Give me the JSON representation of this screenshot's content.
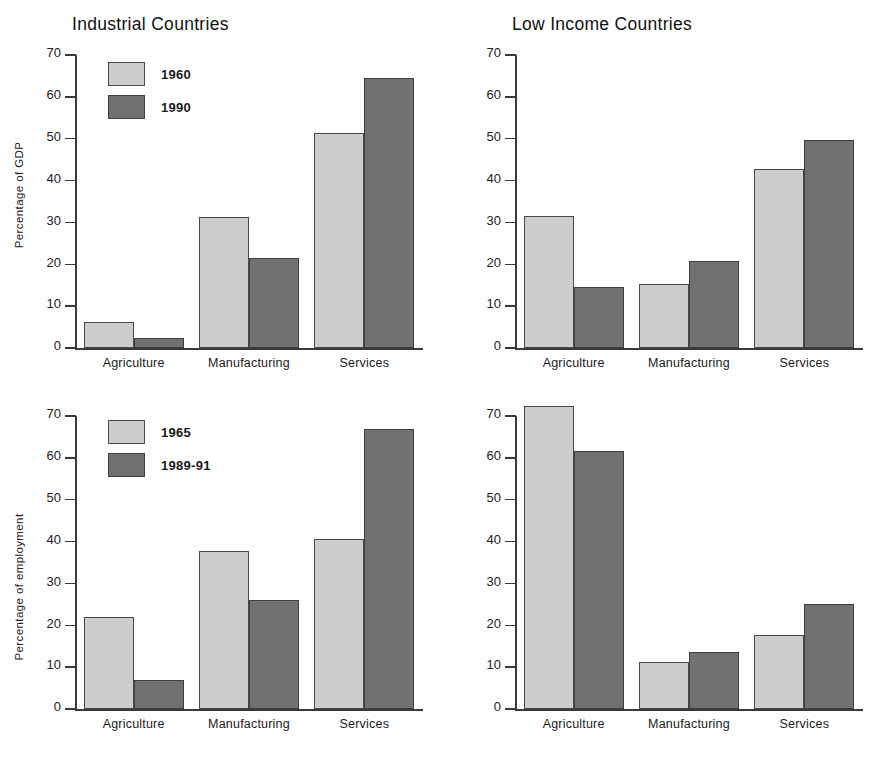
{
  "chart_data": [
    {
      "id": "industrial-gdp",
      "type": "bar",
      "title": "Industrial Countries",
      "xlabel": "",
      "ylabel": "Percentage of GDP",
      "ylim": [
        0,
        70
      ],
      "yticks": [
        0,
        10,
        20,
        30,
        40,
        50,
        60,
        70
      ],
      "grid": false,
      "legend_position": "top-left",
      "categories": [
        "Agriculture",
        "Manufacturing",
        "Services"
      ],
      "series": [
        {
          "name": "1960",
          "color": "#cdcdcd",
          "values": [
            6.3,
            31.2,
            51.4
          ]
        },
        {
          "name": "1990",
          "color": "#717171",
          "values": [
            2.5,
            21.6,
            64.6
          ]
        }
      ]
    },
    {
      "id": "lowincome-gdp",
      "type": "bar",
      "title": "Low Income Countries",
      "xlabel": "",
      "ylabel": "",
      "ylim": [
        0,
        70
      ],
      "yticks": [
        0,
        10,
        20,
        30,
        40,
        50,
        60,
        70
      ],
      "grid": false,
      "legend_position": "top-left",
      "categories": [
        "Agriculture",
        "Manufacturing",
        "Services"
      ],
      "series": [
        {
          "name": "1960",
          "color": "#cdcdcd",
          "values": [
            31.5,
            15.2,
            42.7
          ]
        },
        {
          "name": "1990",
          "color": "#717171",
          "values": [
            14.5,
            20.7,
            49.8
          ]
        }
      ]
    },
    {
      "id": "industrial-employment",
      "type": "bar",
      "title": "",
      "xlabel": "",
      "ylabel": "Percentage of employment",
      "ylim": [
        0,
        70
      ],
      "yticks": [
        0,
        10,
        20,
        30,
        40,
        50,
        60,
        70
      ],
      "grid": false,
      "legend_position": "top-left",
      "categories": [
        "Agriculture",
        "Manufacturing",
        "Services"
      ],
      "series": [
        {
          "name": "1965",
          "color": "#cdcdcd",
          "values": [
            22.0,
            37.8,
            40.6
          ]
        },
        {
          "name": "1989-91",
          "color": "#717171",
          "values": [
            6.9,
            26.0,
            66.9
          ]
        }
      ]
    },
    {
      "id": "lowincome-employment",
      "type": "bar",
      "title": "",
      "xlabel": "",
      "ylabel": "",
      "ylim": [
        0,
        70
      ],
      "yticks": [
        0,
        10,
        20,
        30,
        40,
        50,
        60,
        70
      ],
      "grid": false,
      "legend_position": "top-right",
      "categories": [
        "Agriculture",
        "Manufacturing",
        "Services"
      ],
      "series": [
        {
          "name": "1965",
          "color": "#cdcdcd",
          "values": [
            72.4,
            11.2,
            17.6
          ]
        },
        {
          "name": "1989-91",
          "color": "#717171",
          "values": [
            61.7,
            13.7,
            25.2
          ]
        }
      ]
    }
  ],
  "colors": {
    "light_gray": "#cdcdcd",
    "dark_gray": "#717171",
    "axis": "#3a3a3a",
    "text": "#1a1a1a",
    "background": "#ffffff"
  }
}
